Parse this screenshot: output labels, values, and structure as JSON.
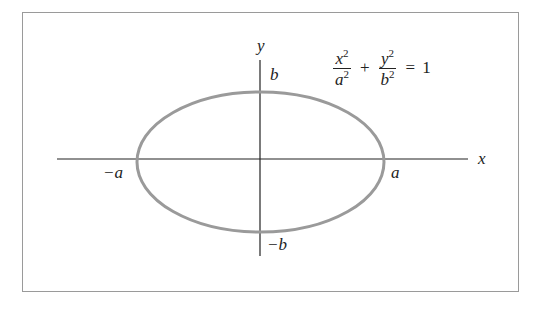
{
  "diagram": {
    "equation": {
      "term1": {
        "numerator": "x",
        "numerator_exp": "2",
        "denominator": "a",
        "denominator_exp": "2"
      },
      "plus": "+",
      "term2": {
        "numerator": "y",
        "numerator_exp": "2",
        "denominator": "b",
        "denominator_exp": "2"
      },
      "equals": "=",
      "rhs": "1"
    },
    "axes": {
      "x_label": "x",
      "y_label": "y"
    },
    "intercepts": {
      "pos_x": "a",
      "neg_x": "−a",
      "pos_y": "b",
      "neg_y": "−b"
    },
    "colors": {
      "ellipse_stroke": "#9a9a9a",
      "axis": "#222222",
      "frame": "#9a9a9a"
    }
  }
}
